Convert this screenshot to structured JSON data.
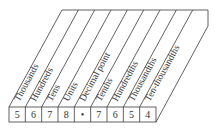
{
  "diagram": {
    "columns": [
      {
        "label": "Thousands",
        "digit": "5"
      },
      {
        "label": "Hundreds",
        "digit": "6"
      },
      {
        "label": "Tens",
        "digit": "7"
      },
      {
        "label": "Units",
        "digit": "8"
      },
      {
        "label": "Decimal point",
        "digit": "•"
      },
      {
        "label": "Tenths",
        "digit": "7"
      },
      {
        "label": "Hundredths",
        "digit": "6"
      },
      {
        "label": "Thousandths",
        "digit": "5"
      },
      {
        "label": "Ten-thousandths",
        "digit": "4"
      }
    ],
    "colors": {
      "line": "#3a3a3a",
      "text": "#333333",
      "background": "#ffffff"
    }
  }
}
